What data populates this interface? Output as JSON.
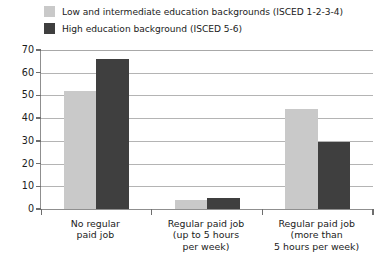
{
  "legend": {
    "position": "top-left",
    "items": [
      {
        "label": "Low and intermediate education backgrounds (ISCED 1-2-3-4)",
        "color": "#c9c9c9",
        "swatch_name": "legend-swatch-low-intermediate"
      },
      {
        "label": "High education background (ISCED 5-6)",
        "color": "#3f3f3f",
        "swatch_name": "legend-swatch-high"
      }
    ]
  },
  "chart_data": {
    "type": "bar",
    "title": "",
    "subtitle": "",
    "xlabel": "",
    "ylabel": "",
    "ylim": [
      0,
      70
    ],
    "yticks": [
      0,
      10,
      20,
      30,
      40,
      50,
      60,
      70
    ],
    "ytick_labels": [
      "0",
      "10",
      "20",
      "30",
      "40",
      "50",
      "60",
      "70"
    ],
    "grid": true,
    "grid_axis": "y",
    "legend_position": "top-left",
    "categories": [
      "No regular\npaid job",
      "Regular paid job\n(up to 5 hours\nper week)",
      "Regular paid job\n(more than\n5 hours per week)"
    ],
    "category_lines": [
      [
        "No regular",
        "paid job"
      ],
      [
        "Regular paid job",
        "(up to 5 hours",
        "per week)"
      ],
      [
        "Regular paid job",
        "(more than",
        "5 hours per week)"
      ]
    ],
    "series": [
      {
        "name": "Low and intermediate education backgrounds (ISCED 1-2-3-4)",
        "color": "#c9c9c9",
        "values": [
          52,
          4,
          44
        ]
      },
      {
        "name": "High education background (ISCED 5-6)",
        "color": "#3f3f3f",
        "values": [
          66,
          5,
          29.5
        ]
      }
    ]
  }
}
